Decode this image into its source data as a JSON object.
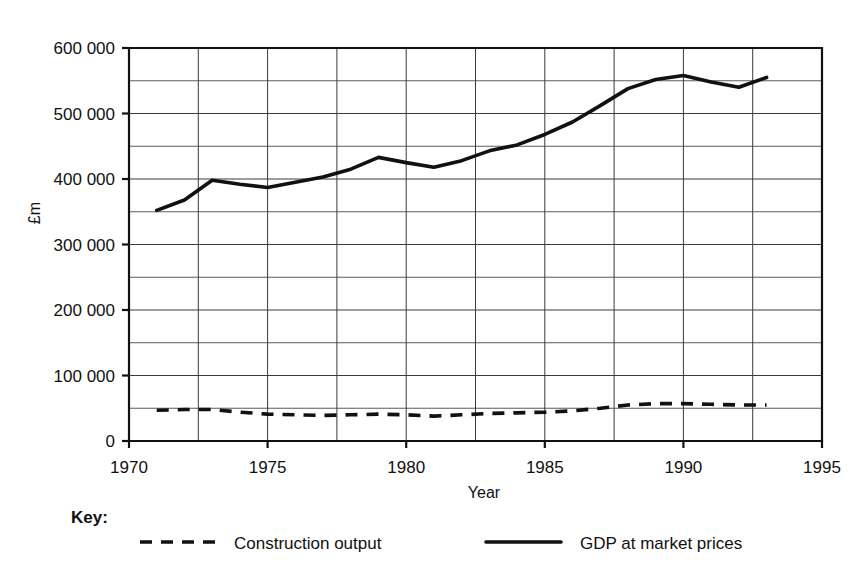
{
  "chart_data": {
    "type": "line",
    "title": "",
    "subtitle": "",
    "xlabel": "Year",
    "ylabel": "£m",
    "xlim": [
      1970,
      1995
    ],
    "ylim": [
      0,
      600000
    ],
    "grid": true,
    "x_ticks": [
      1970,
      1975,
      1980,
      1985,
      1990,
      1995
    ],
    "x_tick_labels": [
      "1970",
      "1975",
      "1980",
      "1985",
      "1990",
      "1995"
    ],
    "x_minor_step": 2.5,
    "y_ticks": [
      0,
      100000,
      200000,
      300000,
      400000,
      500000,
      600000
    ],
    "y_tick_labels": [
      "0",
      "100 000",
      "200 000",
      "300 000",
      "400 000",
      "500 000",
      "600 000"
    ],
    "y_minor_step": 50000,
    "legend_position": "bottom",
    "legend_title": "Key:",
    "series": [
      {
        "name": "Construction output",
        "style": "dashed",
        "color": "#111111",
        "x": [
          1971,
          1972,
          1973,
          1974,
          1975,
          1976,
          1977,
          1978,
          1979,
          1980,
          1981,
          1982,
          1983,
          1984,
          1985,
          1986,
          1987,
          1988,
          1989,
          1990,
          1991,
          1992,
          1993
        ],
        "values": [
          47000,
          48000,
          48000,
          44000,
          41000,
          40000,
          39000,
          40000,
          41000,
          40000,
          38000,
          40000,
          42000,
          43000,
          44000,
          46000,
          50000,
          55000,
          57000,
          57000,
          56000,
          55000,
          55000
        ]
      },
      {
        "name": "GDP at market prices",
        "style": "solid",
        "color": "#111111",
        "x": [
          1971,
          1972,
          1973,
          1974,
          1975,
          1976,
          1977,
          1978,
          1979,
          1980,
          1981,
          1982,
          1983,
          1984,
          1985,
          1986,
          1987,
          1988,
          1989,
          1990,
          1991,
          1992,
          1993
        ],
        "values": [
          352000,
          368000,
          398000,
          392000,
          387000,
          395000,
          403000,
          415000,
          433000,
          425000,
          418000,
          428000,
          443000,
          452000,
          468000,
          487000,
          512000,
          538000,
          552000,
          558000,
          548000,
          540000,
          555000
        ]
      }
    ]
  },
  "axis": {
    "y_title": "£m",
    "x_title": "Year"
  },
  "legend": {
    "key_label": "Key:",
    "entries": [
      {
        "label": "Construction output",
        "style": "dashed"
      },
      {
        "label": "GDP at market prices",
        "style": "solid"
      }
    ]
  }
}
